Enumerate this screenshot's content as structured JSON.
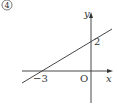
{
  "problem_number": "4",
  "graph": {
    "x_axis_label": "x",
    "y_axis_label": "y",
    "origin_label": "O",
    "y_intercept_label": "2",
    "x_intercept_label": "−3",
    "y_intercept": 2,
    "x_intercept": -3,
    "line_equation": "y = (2/3)x + 2",
    "line_color": "#333333",
    "axis_color": "#333333"
  }
}
